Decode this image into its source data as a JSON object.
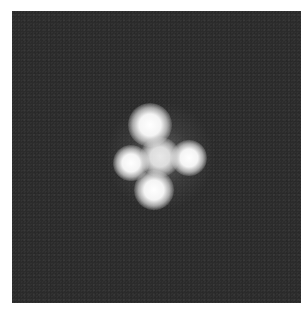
{
  "image": {
    "subject": "quadruply lensed quasar (cross-shaped arrangement of four bright point sources around a central galaxy)",
    "background_color": "#2b2b2b",
    "border_color": "#ffffff",
    "sources": [
      {
        "name": "top",
        "cx": 138,
        "cy": 114,
        "r": 22
      },
      {
        "name": "left",
        "cx": 119,
        "cy": 152,
        "r": 18
      },
      {
        "name": "right",
        "cx": 177,
        "cy": 147,
        "r": 18
      },
      {
        "name": "bottom",
        "cx": 142,
        "cy": 179,
        "r": 20
      },
      {
        "name": "center",
        "cx": 148,
        "cy": 146,
        "r": 22
      }
    ]
  }
}
